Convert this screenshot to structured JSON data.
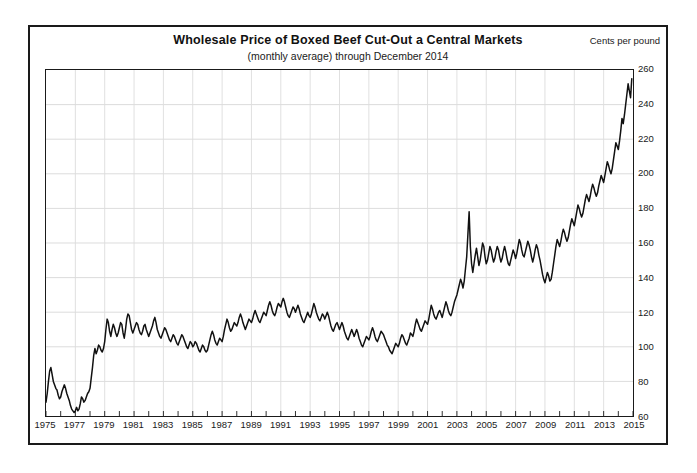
{
  "chart_data": {
    "type": "line",
    "title": "Wholesale Price of Boxed Beef Cut-Out a Central Markets",
    "subtitle": "(monthly average) through December 2014",
    "unit_label": "Cents per pound",
    "xlabel": "",
    "ylabel": "Cents per pound",
    "xlim": [
      1975,
      2015
    ],
    "ylim": [
      60,
      260
    ],
    "grid": true,
    "legend": "none",
    "y_ticks": [
      60,
      80,
      100,
      120,
      140,
      160,
      180,
      200,
      220,
      240,
      260
    ],
    "x_ticks": [
      1975,
      1977,
      1979,
      1981,
      1983,
      1985,
      1987,
      1989,
      1991,
      1993,
      1995,
      1997,
      1999,
      2001,
      2003,
      2005,
      2007,
      2009,
      2011,
      2013,
      2015
    ],
    "x_minor_step": 1,
    "series": [
      {
        "name": "Boxed Beef Cut-Out Value",
        "color": "#111111",
        "x": [
          1975.0,
          1975.083,
          1975.167,
          1975.25,
          1975.333,
          1975.417,
          1975.5,
          1975.583,
          1975.667,
          1975.75,
          1975.833,
          1975.917,
          1976.0,
          1976.083,
          1976.167,
          1976.25,
          1976.333,
          1976.417,
          1976.5,
          1976.583,
          1976.667,
          1976.75,
          1976.833,
          1976.917,
          1977.0,
          1977.083,
          1977.167,
          1977.25,
          1977.333,
          1977.417,
          1977.5,
          1977.583,
          1977.667,
          1977.75,
          1977.833,
          1977.917,
          1978.0,
          1978.083,
          1978.167,
          1978.25,
          1978.333,
          1978.417,
          1978.5,
          1978.583,
          1978.667,
          1978.75,
          1978.833,
          1978.917,
          1979.0,
          1979.083,
          1979.167,
          1979.25,
          1979.333,
          1979.417,
          1979.5,
          1979.583,
          1979.667,
          1979.75,
          1979.833,
          1979.917,
          1980.0,
          1980.083,
          1980.167,
          1980.25,
          1980.333,
          1980.417,
          1980.5,
          1980.583,
          1980.667,
          1980.75,
          1980.833,
          1980.917,
          1981.0,
          1981.083,
          1981.167,
          1981.25,
          1981.333,
          1981.417,
          1981.5,
          1981.583,
          1981.667,
          1981.75,
          1981.833,
          1981.917,
          1982.0,
          1982.083,
          1982.167,
          1982.25,
          1982.333,
          1982.417,
          1982.5,
          1982.583,
          1982.667,
          1982.75,
          1982.833,
          1982.917,
          1983.0,
          1983.083,
          1983.167,
          1983.25,
          1983.333,
          1983.417,
          1983.5,
          1983.583,
          1983.667,
          1983.75,
          1983.833,
          1983.917,
          1984.0,
          1984.083,
          1984.167,
          1984.25,
          1984.333,
          1984.417,
          1984.5,
          1984.583,
          1984.667,
          1984.75,
          1984.833,
          1984.917,
          1985.0,
          1985.083,
          1985.167,
          1985.25,
          1985.333,
          1985.417,
          1985.5,
          1985.583,
          1985.667,
          1985.75,
          1985.833,
          1985.917,
          1986.0,
          1986.083,
          1986.167,
          1986.25,
          1986.333,
          1986.417,
          1986.5,
          1986.583,
          1986.667,
          1986.75,
          1986.833,
          1986.917,
          1987.0,
          1987.083,
          1987.167,
          1987.25,
          1987.333,
          1987.417,
          1987.5,
          1987.583,
          1987.667,
          1987.75,
          1987.833,
          1987.917,
          1988.0,
          1988.083,
          1988.167,
          1988.25,
          1988.333,
          1988.417,
          1988.5,
          1988.583,
          1988.667,
          1988.75,
          1988.833,
          1988.917,
          1989.0,
          1989.083,
          1989.167,
          1989.25,
          1989.333,
          1989.417,
          1989.5,
          1989.583,
          1989.667,
          1989.75,
          1989.833,
          1989.917,
          1990.0,
          1990.083,
          1990.167,
          1990.25,
          1990.333,
          1990.417,
          1990.5,
          1990.583,
          1990.667,
          1990.75,
          1990.833,
          1990.917,
          1991.0,
          1991.083,
          1991.167,
          1991.25,
          1991.333,
          1991.417,
          1991.5,
          1991.583,
          1991.667,
          1991.75,
          1991.833,
          1991.917,
          1992.0,
          1992.083,
          1992.167,
          1992.25,
          1992.333,
          1992.417,
          1992.5,
          1992.583,
          1992.667,
          1992.75,
          1992.833,
          1992.917,
          1993.0,
          1993.083,
          1993.167,
          1993.25,
          1993.333,
          1993.417,
          1993.5,
          1993.583,
          1993.667,
          1993.75,
          1993.833,
          1993.917,
          1994.0,
          1994.083,
          1994.167,
          1994.25,
          1994.333,
          1994.417,
          1994.5,
          1994.583,
          1994.667,
          1994.75,
          1994.833,
          1994.917,
          1995.0,
          1995.083,
          1995.167,
          1995.25,
          1995.333,
          1995.417,
          1995.5,
          1995.583,
          1995.667,
          1995.75,
          1995.833,
          1995.917,
          1996.0,
          1996.083,
          1996.167,
          1996.25,
          1996.333,
          1996.417,
          1996.5,
          1996.583,
          1996.667,
          1996.75,
          1996.833,
          1996.917,
          1997.0,
          1997.083,
          1997.167,
          1997.25,
          1997.333,
          1997.417,
          1997.5,
          1997.583,
          1997.667,
          1997.75,
          1997.833,
          1997.917,
          1998.0,
          1998.083,
          1998.167,
          1998.25,
          1998.333,
          1998.417,
          1998.5,
          1998.583,
          1998.667,
          1998.75,
          1998.833,
          1998.917,
          1999.0,
          1999.083,
          1999.167,
          1999.25,
          1999.333,
          1999.417,
          1999.5,
          1999.583,
          1999.667,
          1999.75,
          1999.833,
          1999.917,
          2000.0,
          2000.083,
          2000.167,
          2000.25,
          2000.333,
          2000.417,
          2000.5,
          2000.583,
          2000.667,
          2000.75,
          2000.833,
          2000.917,
          2001.0,
          2001.083,
          2001.167,
          2001.25,
          2001.333,
          2001.417,
          2001.5,
          2001.583,
          2001.667,
          2001.75,
          2001.833,
          2001.917,
          2002.0,
          2002.083,
          2002.167,
          2002.25,
          2002.333,
          2002.417,
          2002.5,
          2002.583,
          2002.667,
          2002.75,
          2002.833,
          2002.917,
          2003.0,
          2003.083,
          2003.167,
          2003.25,
          2003.333,
          2003.417,
          2003.5,
          2003.583,
          2003.667,
          2003.75,
          2003.833,
          2003.917,
          2004.0,
          2004.083,
          2004.167,
          2004.25,
          2004.333,
          2004.417,
          2004.5,
          2004.583,
          2004.667,
          2004.75,
          2004.833,
          2004.917,
          2005.0,
          2005.083,
          2005.167,
          2005.25,
          2005.333,
          2005.417,
          2005.5,
          2005.583,
          2005.667,
          2005.75,
          2005.833,
          2005.917,
          2006.0,
          2006.083,
          2006.167,
          2006.25,
          2006.333,
          2006.417,
          2006.5,
          2006.583,
          2006.667,
          2006.75,
          2006.833,
          2006.917,
          2007.0,
          2007.083,
          2007.167,
          2007.25,
          2007.333,
          2007.417,
          2007.5,
          2007.583,
          2007.667,
          2007.75,
          2007.833,
          2007.917,
          2008.0,
          2008.083,
          2008.167,
          2008.25,
          2008.333,
          2008.417,
          2008.5,
          2008.583,
          2008.667,
          2008.75,
          2008.833,
          2008.917,
          2009.0,
          2009.083,
          2009.167,
          2009.25,
          2009.333,
          2009.417,
          2009.5,
          2009.583,
          2009.667,
          2009.75,
          2009.833,
          2009.917,
          2010.0,
          2010.083,
          2010.167,
          2010.25,
          2010.333,
          2010.417,
          2010.5,
          2010.583,
          2010.667,
          2010.75,
          2010.833,
          2010.917,
          2011.0,
          2011.083,
          2011.167,
          2011.25,
          2011.333,
          2011.417,
          2011.5,
          2011.583,
          2011.667,
          2011.75,
          2011.833,
          2011.917,
          2012.0,
          2012.083,
          2012.167,
          2012.25,
          2012.333,
          2012.417,
          2012.5,
          2012.583,
          2012.667,
          2012.75,
          2012.833,
          2012.917,
          2013.0,
          2013.083,
          2013.167,
          2013.25,
          2013.333,
          2013.417,
          2013.5,
          2013.583,
          2013.667,
          2013.75,
          2013.833,
          2013.917,
          2014.0,
          2014.083,
          2014.167,
          2014.25,
          2014.333,
          2014.417,
          2014.5,
          2014.583,
          2014.667,
          2014.75,
          2014.833,
          2014.917
        ],
        "values": [
          68,
          73,
          80,
          86,
          88,
          84,
          80,
          78,
          76,
          75,
          72,
          70,
          71,
          74,
          76,
          78,
          76,
          73,
          71,
          69,
          66,
          64,
          63,
          62,
          63,
          65,
          63,
          64,
          67,
          71,
          70,
          68,
          69,
          71,
          73,
          74,
          76,
          82,
          88,
          95,
          99,
          96,
          98,
          101,
          100,
          98,
          97,
          99,
          103,
          110,
          116,
          114,
          109,
          106,
          110,
          113,
          111,
          108,
          106,
          108,
          111,
          114,
          113,
          108,
          105,
          110,
          116,
          119,
          118,
          114,
          110,
          108,
          110,
          112,
          114,
          113,
          110,
          108,
          107,
          109,
          112,
          113,
          110,
          108,
          106,
          108,
          110,
          112,
          115,
          117,
          114,
          110,
          108,
          106,
          105,
          107,
          109,
          111,
          110,
          108,
          106,
          104,
          103,
          105,
          107,
          106,
          104,
          102,
          101,
          103,
          105,
          107,
          106,
          104,
          102,
          100,
          99,
          101,
          103,
          102,
          100,
          101,
          103,
          102,
          100,
          98,
          97,
          99,
          101,
          100,
          98,
          97,
          98,
          101,
          104,
          107,
          109,
          107,
          104,
          102,
          101,
          103,
          105,
          104,
          103,
          106,
          110,
          113,
          116,
          114,
          111,
          109,
          110,
          112,
          114,
          113,
          112,
          114,
          117,
          119,
          117,
          114,
          112,
          110,
          112,
          114,
          116,
          115,
          114,
          116,
          119,
          121,
          119,
          117,
          115,
          114,
          116,
          118,
          120,
          119,
          118,
          121,
          124,
          126,
          124,
          121,
          119,
          118,
          120,
          123,
          125,
          124,
          123,
          126,
          128,
          126,
          123,
          120,
          118,
          117,
          119,
          121,
          123,
          122,
          120,
          122,
          124,
          122,
          119,
          117,
          115,
          114,
          116,
          118,
          120,
          118,
          117,
          119,
          122,
          125,
          123,
          120,
          118,
          116,
          115,
          117,
          119,
          118,
          116,
          118,
          120,
          118,
          115,
          112,
          110,
          109,
          111,
          113,
          114,
          112,
          110,
          112,
          114,
          112,
          109,
          107,
          105,
          104,
          106,
          108,
          110,
          108,
          106,
          108,
          110,
          108,
          105,
          103,
          101,
          100,
          102,
          104,
          106,
          105,
          104,
          106,
          109,
          111,
          109,
          106,
          104,
          103,
          105,
          107,
          109,
          108,
          107,
          105,
          103,
          101,
          100,
          98,
          97,
          96,
          98,
          100,
          102,
          101,
          100,
          102,
          105,
          107,
          106,
          104,
          102,
          101,
          103,
          105,
          108,
          107,
          106,
          109,
          113,
          116,
          114,
          112,
          110,
          109,
          111,
          113,
          115,
          114,
          113,
          116,
          120,
          124,
          122,
          119,
          117,
          116,
          118,
          120,
          121,
          119,
          117,
          120,
          123,
          126,
          124,
          121,
          119,
          118,
          120,
          123,
          126,
          128,
          130,
          133,
          136,
          139,
          137,
          134,
          138,
          145,
          152,
          165,
          178,
          158,
          148,
          143,
          148,
          153,
          157,
          152,
          147,
          150,
          155,
          160,
          158,
          152,
          148,
          150,
          154,
          158,
          156,
          152,
          149,
          151,
          155,
          158,
          156,
          152,
          149,
          151,
          155,
          158,
          155,
          151,
          148,
          147,
          150,
          153,
          156,
          154,
          151,
          154,
          158,
          162,
          160,
          156,
          153,
          152,
          155,
          158,
          161,
          159,
          156,
          152,
          149,
          152,
          156,
          159,
          157,
          153,
          150,
          146,
          142,
          139,
          137,
          140,
          143,
          141,
          138,
          139,
          143,
          148,
          153,
          158,
          162,
          160,
          158,
          161,
          165,
          168,
          166,
          163,
          161,
          163,
          167,
          171,
          174,
          172,
          170,
          174,
          178,
          182,
          180,
          177,
          175,
          177,
          181,
          185,
          188,
          186,
          184,
          187,
          191,
          194,
          192,
          189,
          187,
          189,
          193,
          196,
          199,
          197,
          195,
          199,
          203,
          207,
          205,
          202,
          200,
          203,
          208,
          213,
          218,
          216,
          214,
          219,
          225,
          232,
          229,
          234,
          240,
          246,
          252,
          248,
          244,
          255
        ]
      }
    ]
  }
}
